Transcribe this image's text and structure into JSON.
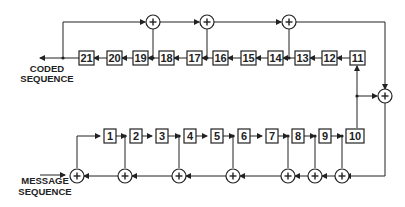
{
  "diagram": {
    "title": "",
    "labels": {
      "output_line1": "CODED",
      "output_line2": "SEQUENCE",
      "input_line1": "MESSAGE",
      "input_line2": "SEQUENCE"
    },
    "top_registers": [
      "21",
      "20",
      "19",
      "18",
      "17",
      "16",
      "15",
      "14",
      "13",
      "12",
      "11"
    ],
    "bottom_registers": [
      "1",
      "2",
      "3",
      "4",
      "5",
      "6",
      "7",
      "8",
      "9",
      "10"
    ],
    "adder_symbol": "+",
    "colors": {
      "line": "#222222",
      "background": "#ffffff"
    }
  }
}
